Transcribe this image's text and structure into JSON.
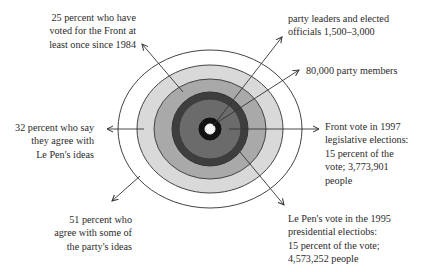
{
  "diagram": {
    "type": "concentric-rings",
    "center": {
      "x": 210,
      "y": 129
    },
    "rings": [
      {
        "id": "agree-some-ideas",
        "rx": 92,
        "ry": 79,
        "fill": "#ffffff",
        "stroke": "#444444"
      },
      {
        "id": "agree-le-pen",
        "rx": 73,
        "ry": 64,
        "fill": "#d9d9d9",
        "stroke": "#444444"
      },
      {
        "id": "voted-since-1984",
        "rx": 56,
        "ry": 50,
        "fill": "#a9a9a9",
        "stroke": "#444444"
      },
      {
        "id": "presidential-1995",
        "rx": 38,
        "ry": 37,
        "fill": "#3e3e3e",
        "stroke": "#333333"
      },
      {
        "id": "legislative-1997",
        "rx": 31,
        "ry": 30,
        "fill": "#6b6b6b",
        "stroke": "#3a3a3a"
      },
      {
        "id": "party-members",
        "rx": 11,
        "ry": 11,
        "fill": "#111111",
        "stroke": "#111111"
      },
      {
        "id": "leaders-officials",
        "rx": 5,
        "ry": 5,
        "fill": "#f4f4f4",
        "stroke": "#f4f4f4"
      }
    ],
    "arrows": [
      {
        "id": "arrow-1984",
        "x1": 183,
        "y1": 92,
        "x2": 142,
        "y2": 44
      },
      {
        "id": "arrow-32pct",
        "x1": 144,
        "y1": 129,
        "x2": 107,
        "y2": 129
      },
      {
        "id": "arrow-51pct",
        "x1": 140,
        "y1": 176,
        "x2": 112,
        "y2": 201
      },
      {
        "id": "arrow-leaders",
        "x1": 213,
        "y1": 126,
        "x2": 282,
        "y2": 37
      },
      {
        "id": "arrow-members",
        "x1": 218,
        "y1": 122,
        "x2": 299,
        "y2": 70
      },
      {
        "id": "arrow-1997",
        "x1": 229,
        "y1": 129,
        "x2": 319,
        "y2": 129
      },
      {
        "id": "arrow-1995",
        "x1": 240,
        "y1": 152,
        "x2": 284,
        "y2": 205
      }
    ]
  },
  "labels": {
    "voted_1984": "25 percent who have\nvoted for the Front at\nleast once since 1984",
    "agree_le_pen": "32 percent who say\nthey agree with\nLe Pen's ideas",
    "agree_some": "51 percent who\nagree with some of\nthe party's ideas",
    "leaders": "party leaders and elected\nofficials 1,500–3,000",
    "members": "80,000 party members",
    "legislative_1997": "Front vote in 1997\nlegislative elections:\n15 percent of the\nvote; 3,773,901\npeople",
    "presidential_1995": "Le Pen's vote in the 1995\npresidential electiobs:\n15 percent of the vote;\n4,573,252 people"
  }
}
